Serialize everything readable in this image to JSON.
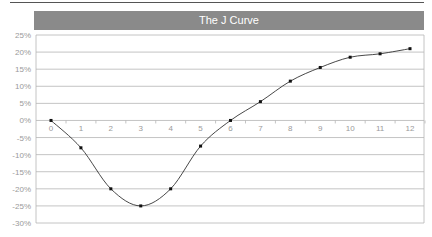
{
  "chart_data": {
    "type": "line",
    "title": "The J Curve",
    "xlabel": "",
    "ylabel": "",
    "x": [
      0,
      1,
      2,
      3,
      4,
      5,
      6,
      7,
      8,
      9,
      10,
      11,
      12
    ],
    "categories": [
      "0",
      "1",
      "2",
      "3",
      "4",
      "5",
      "6",
      "7",
      "8",
      "9",
      "10",
      "11",
      "12"
    ],
    "series": [
      {
        "name": "J Curve",
        "values": [
          0,
          -8,
          -20,
          -25,
          -20,
          -7.5,
          0,
          5.5,
          11.5,
          15.5,
          18.5,
          19.5,
          21
        ],
        "color": "#333333",
        "smooth": true,
        "markers": true
      }
    ],
    "ylim": [
      -30,
      25
    ],
    "yticks": [
      25,
      20,
      15,
      10,
      5,
      0,
      -5,
      -10,
      -15,
      -20,
      -25,
      -30
    ],
    "ytick_labels": [
      "25%",
      "20%",
      "15%",
      "10%",
      "5%",
      "0%",
      "-5%",
      "-10%",
      "-15%",
      "-20%",
      "-25%",
      "-30%"
    ],
    "grid": true,
    "legend": "none"
  },
  "colors": {
    "title_bar": "#8a8a8a",
    "title_text": "#ffffff",
    "gridline": "#b5b5b5",
    "tick_text": "#9a9a9a",
    "line": "#333333"
  }
}
